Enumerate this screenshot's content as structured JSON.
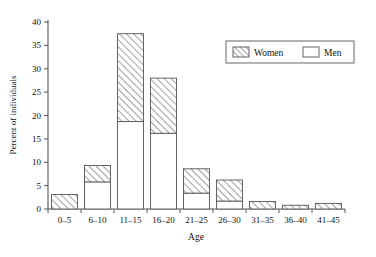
{
  "chart_data": {
    "type": "bar",
    "subtype": "stacked-bar",
    "title": "",
    "xlabel": "Age",
    "ylabel": "Percent of individuals",
    "categories": [
      "0–5",
      "6–10",
      "11–15",
      "16–20",
      "21–25",
      "26–30",
      "31–35",
      "36–40",
      "41–45"
    ],
    "series": [
      {
        "name": "Men",
        "fill": "white",
        "values": [
          0,
          5.8,
          18.7,
          16.2,
          3.4,
          1.7,
          0,
          0,
          0
        ]
      },
      {
        "name": "Women",
        "fill": "hatched",
        "values": [
          3.1,
          3.5,
          18.8,
          11.8,
          5.2,
          4.5,
          1.6,
          0.8,
          1.2
        ]
      }
    ],
    "totals": [
      3.1,
      9.3,
      37.5,
      28.0,
      8.6,
      6.2,
      1.6,
      0.8,
      1.2
    ],
    "ylim": [
      0,
      40
    ],
    "yticks": [
      0,
      5,
      10,
      15,
      20,
      25,
      30,
      35,
      40
    ],
    "ytick_labels": [
      "0",
      "5",
      "10",
      "15",
      "20",
      "25",
      "30",
      "35",
      "40"
    ],
    "grid": false,
    "legend_position": "top-right",
    "stack_order": "Men bottom, Women top"
  },
  "legend": {
    "entries": [
      {
        "label": "Women",
        "swatch": "hatched-swatch"
      },
      {
        "label": "Men",
        "swatch": "white-swatch"
      }
    ]
  },
  "axes": {
    "y_title": "Percent of individuals",
    "x_title": "Age"
  },
  "colors": {
    "axis": "#555555",
    "hatch": "#555555",
    "bar_fill_men": "#ffffff",
    "background": "#ffffff"
  }
}
